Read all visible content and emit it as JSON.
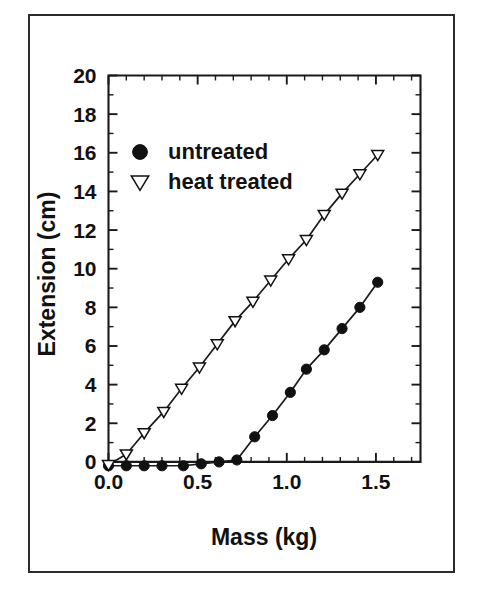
{
  "figure": {
    "background_color": "#ffffff",
    "border_color": "#2b2b2b",
    "ink_color": "#111111"
  },
  "chart_data": {
    "type": "line",
    "title": "",
    "subtitle": "",
    "xlabel": "Mass (kg)",
    "ylabel": "Extension (cm)",
    "xlim": [
      0.0,
      1.75
    ],
    "ylim": [
      -0.6,
      20.0
    ],
    "xticks": [
      0.0,
      0.5,
      1.0,
      1.5
    ],
    "xticklabels": [
      "0.0",
      "0.5",
      "1.0",
      "1.5"
    ],
    "xtick_minor_step": 0.1,
    "yticks": [
      0,
      2,
      4,
      6,
      8,
      10,
      12,
      14,
      16,
      18,
      20
    ],
    "yticklabels": [
      "0",
      "2",
      "4",
      "6",
      "8",
      "10",
      "12",
      "14",
      "16",
      "18",
      "20"
    ],
    "ytick_minor_step": 1,
    "grid": false,
    "legend_position": "upper left inside axes",
    "series": [
      {
        "name": "untreated",
        "marker": "filled-circle",
        "x": [
          0.0,
          0.1,
          0.2,
          0.3,
          0.42,
          0.52,
          0.62,
          0.72,
          0.82,
          0.92,
          1.02,
          1.11,
          1.21,
          1.31,
          1.41,
          1.51
        ],
        "values": [
          -0.2,
          -0.2,
          -0.2,
          -0.2,
          -0.2,
          -0.1,
          0.0,
          0.1,
          1.3,
          2.4,
          3.6,
          4.8,
          5.8,
          6.9,
          8.0,
          9.3
        ]
      },
      {
        "name": "heat treated",
        "marker": "open-down-triangle",
        "x": [
          0.0,
          0.1,
          0.2,
          0.31,
          0.41,
          0.51,
          0.61,
          0.71,
          0.81,
          0.91,
          1.01,
          1.11,
          1.21,
          1.31,
          1.41,
          1.51
        ],
        "values": [
          -0.15,
          0.4,
          1.5,
          2.6,
          3.8,
          4.9,
          6.1,
          7.3,
          8.3,
          9.4,
          10.5,
          11.5,
          12.8,
          13.9,
          14.9,
          15.9
        ]
      }
    ]
  },
  "legend": {
    "entries": [
      {
        "label": "untreated",
        "marker": "filled-circle"
      },
      {
        "label": "heat treated",
        "marker": "open-down-triangle"
      }
    ]
  },
  "axis_titles": {
    "x": "Mass (kg)",
    "y": "Extension (cm)"
  }
}
